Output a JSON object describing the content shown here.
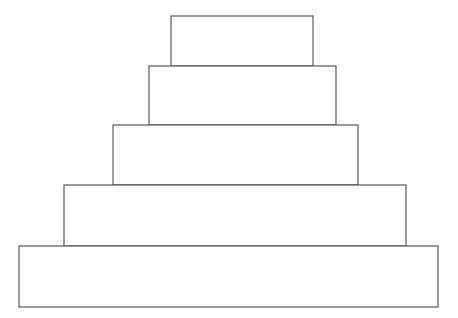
{
  "figure": {
    "background_color": "#ffffff",
    "stroke_color": "#4a4a4a",
    "fill_color": "#ffffff",
    "stroke_width": 1.1,
    "canvas": {
      "width": 458,
      "height": 318
    },
    "tier_count": 5
  },
  "chart_data": {
    "type": "bar",
    "xlabel": "",
    "ylabel": "",
    "grid": false,
    "legend": "none",
    "orientation": "stacked-pyramid",
    "categories": [
      "tier-1",
      "tier-2",
      "tier-3",
      "tier-4",
      "tier-5"
    ],
    "values": [
      142,
      187,
      245,
      342,
      419
    ],
    "xlim": [
      0,
      458
    ],
    "ylim": [
      0,
      318
    ],
    "tiers": [
      {
        "id": "tier-1",
        "label": "top tier",
        "x": 171,
        "y": 16,
        "width": 142,
        "height": 50,
        "center_x": 242
      },
      {
        "id": "tier-2",
        "label": "second tier",
        "x": 149,
        "y": 66,
        "width": 187,
        "height": 59,
        "center_x": 242.5
      },
      {
        "id": "tier-3",
        "label": "third tier",
        "x": 113,
        "y": 125,
        "width": 245,
        "height": 60,
        "center_x": 235.5
      },
      {
        "id": "tier-4",
        "label": "fourth tier",
        "x": 64,
        "y": 185,
        "width": 342,
        "height": 61,
        "center_x": 235
      },
      {
        "id": "tier-5",
        "label": "base tier",
        "x": 19,
        "y": 246,
        "width": 419,
        "height": 61,
        "center_x": 228.5
      }
    ]
  }
}
